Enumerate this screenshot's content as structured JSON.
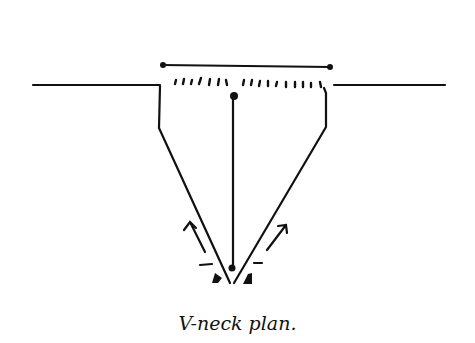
{
  "caption": "V-neck plan.",
  "colors": {
    "ink": "#111111",
    "background": "#ffffff"
  },
  "diagram": {
    "elements": [
      "shoulder-line-left",
      "shoulder-line-right",
      "neck-width-measure-bar",
      "stitch-marks-row",
      "neck-side-left",
      "neck-side-right",
      "v-neck-left-diagonal",
      "v-neck-right-diagonal",
      "center-line",
      "direction-arrow-left",
      "direction-arrow-right",
      "decrease-marks"
    ]
  }
}
